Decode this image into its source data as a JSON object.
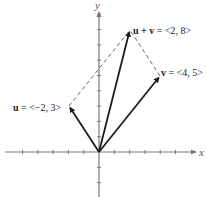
{
  "figure": {
    "x_axis_label": "x",
    "y_axis_label": "y",
    "colors": {
      "axis": "#7a7a7a",
      "vector": "#1e1e1e",
      "dashed": "#555555",
      "text": "#222222"
    },
    "vectors": [
      {
        "name": "u",
        "label_bold": "u",
        "label_rest": " = <−2, 3>",
        "components": [
          -2,
          3
        ]
      },
      {
        "name": "v",
        "label_bold": "v",
        "label_rest": " = <4, 5>",
        "components": [
          4,
          5
        ]
      },
      {
        "name": "u+v",
        "label_bold": "u + v",
        "label_rest": " = <2, 8>",
        "components": [
          2,
          8
        ]
      }
    ],
    "dashed_lines": [
      {
        "from": "u",
        "to": "u+v"
      },
      {
        "from": "v",
        "to": "u+v"
      }
    ],
    "grid": {
      "x_ticks": [
        -5,
        -4,
        -3,
        -2,
        -1,
        1,
        2,
        3,
        4,
        5
      ],
      "y_ticks": [
        -2,
        -1,
        1,
        2,
        3,
        4,
        5,
        6,
        7,
        8,
        9
      ]
    }
  }
}
